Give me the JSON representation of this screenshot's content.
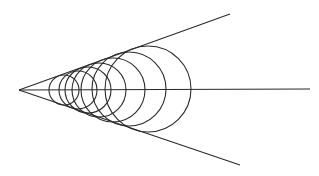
{
  "diagram": {
    "stroke_color": "#2a2a2a",
    "background": "#ffffff",
    "apex": {
      "x": 19,
      "y": 90
    },
    "lines": [
      {
        "name": "upper-ray",
        "x1": 19,
        "y1": 90,
        "x2": 230,
        "y2": 14
      },
      {
        "name": "axis",
        "x1": 19,
        "y1": 90,
        "x2": 310,
        "y2": 89
      },
      {
        "name": "lower-ray",
        "x1": 19,
        "y1": 90,
        "x2": 240,
        "y2": 165
      }
    ],
    "circles": [
      {
        "cx": 64,
        "cy": 90,
        "r": 15
      },
      {
        "cx": 78,
        "cy": 90,
        "r": 19
      },
      {
        "cx": 88,
        "cy": 90,
        "r": 23
      },
      {
        "cx": 99,
        "cy": 90,
        "r": 27
      },
      {
        "cx": 113,
        "cy": 90,
        "r": 32
      },
      {
        "cx": 129,
        "cy": 89,
        "r": 37
      },
      {
        "cx": 148,
        "cy": 89,
        "r": 43
      }
    ]
  }
}
